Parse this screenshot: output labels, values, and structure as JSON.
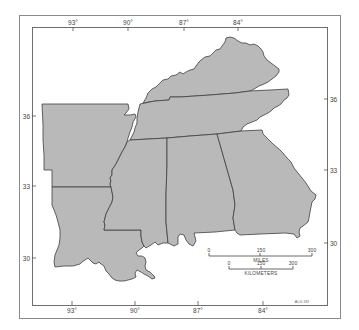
{
  "map": {
    "fill_color": "#b9b9b9",
    "border_color": "#3f3f3f",
    "states": [
      {
        "id": "kentucky"
      },
      {
        "id": "tennessee"
      },
      {
        "id": "arkansas"
      },
      {
        "id": "louisiana"
      },
      {
        "id": "mississippi"
      },
      {
        "id": "alabama"
      },
      {
        "id": "georgia"
      }
    ]
  },
  "graticule": {
    "top_longitudes": [
      "93°",
      "90°",
      "87°",
      "84°"
    ],
    "bottom_longitudes": [
      "93°",
      "90°",
      "87°",
      "84°"
    ],
    "left_latitudes": [
      "36",
      "33",
      "30"
    ],
    "right_latitudes": [
      "36",
      "33",
      "30"
    ]
  },
  "scale_bar": {
    "miles": {
      "ticks": [
        "0",
        "150",
        "300"
      ],
      "title": "MILES"
    },
    "kilometers": {
      "ticks": [
        "0",
        "150",
        "300"
      ],
      "title": "KILOMETERS"
    }
  },
  "figure_id": "ALG-182"
}
